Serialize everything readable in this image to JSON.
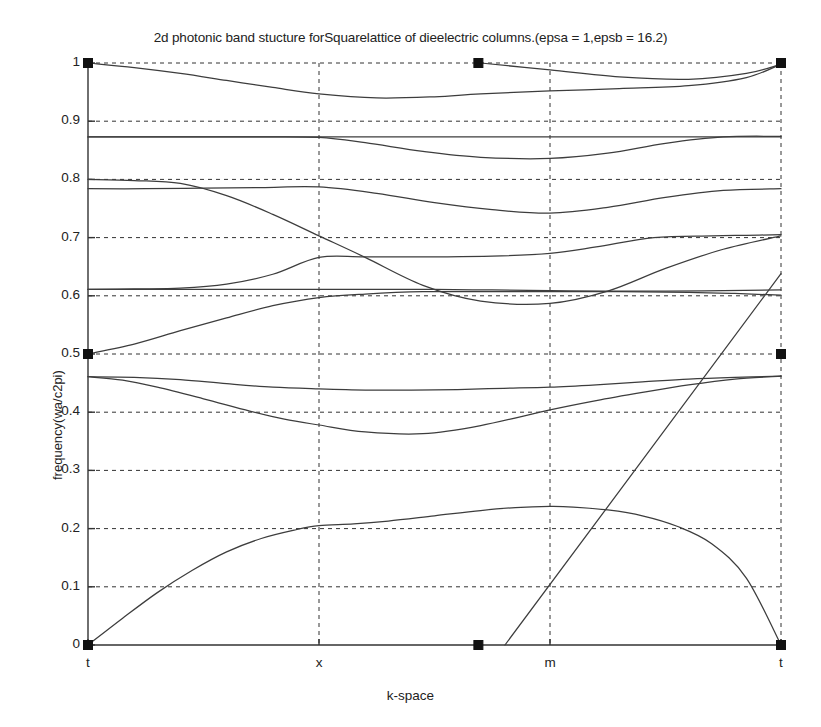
{
  "figure": {
    "title": "2d photonic band stucture forSquarelattice of dieelectric columns.(epsa = 1,epsb = 16.2)",
    "xlabel": "k-space",
    "ylabel": "frequency(wa/c2pi)"
  },
  "chart_data": {
    "type": "line",
    "title": "2d photonic band stucture forSquarelattice of dieelectric columns.(epsa = 1,epsb = 16.2)",
    "xlabel": "k-space",
    "ylabel": "frequency(wa/c2pi)",
    "xlim": [
      0,
      3
    ],
    "ylim": [
      0,
      1
    ],
    "grid": true,
    "legend": null,
    "parameters": {
      "epsa": 1,
      "epsb": 16.2,
      "lattice": "Square"
    },
    "xticks": [
      0,
      1,
      2,
      3
    ],
    "xticklabels": [
      "t",
      "x",
      "m",
      "t"
    ],
    "yticks": [
      0,
      0.1,
      0.2,
      0.3,
      0.4,
      0.5,
      0.6,
      0.7,
      0.8,
      0.9,
      1
    ],
    "yticklabels": [
      "0",
      "0.1",
      "0.2",
      "0.3",
      "0.4",
      "0.5",
      "0.6",
      "0.7",
      "0.8",
      "0.9",
      "1"
    ],
    "symmetry_points": [
      "t",
      "x",
      "m",
      "t"
    ],
    "series": [
      {
        "name": "band-1",
        "x": [
          0.0,
          0.15,
          0.3,
          0.45,
          0.6,
          0.75,
          0.9,
          1.0,
          1.15,
          1.3,
          1.5,
          1.7,
          1.85,
          2.0,
          2.1,
          2.25,
          2.4,
          2.55,
          2.7,
          2.85,
          3.0
        ],
        "y": [
          0.0,
          0.046,
          0.09,
          0.128,
          0.16,
          0.183,
          0.198,
          0.205,
          0.208,
          0.213,
          0.222,
          0.231,
          0.236,
          0.238,
          0.237,
          0.232,
          0.222,
          0.204,
          0.174,
          0.115,
          0.0
        ]
      },
      {
        "name": "band-2",
        "x": [
          0.0,
          0.2,
          0.4,
          0.6,
          0.8,
          1.0,
          1.2,
          1.4,
          1.6,
          1.8,
          2.0,
          2.2,
          2.4,
          2.6,
          2.8,
          3.0
        ],
        "y": [
          0.461,
          0.46,
          0.456,
          0.449,
          0.443,
          0.44,
          0.438,
          0.438,
          0.439,
          0.441,
          0.443,
          0.447,
          0.452,
          0.457,
          0.46,
          0.462
        ]
      },
      {
        "name": "band-3",
        "x": [
          0.0,
          0.15,
          0.3,
          0.5,
          0.7,
          0.85,
          1.0,
          1.2,
          1.45,
          1.7,
          2.0,
          2.2,
          2.4,
          2.6,
          2.8,
          3.0
        ],
        "y": [
          0.461,
          0.455,
          0.443,
          0.423,
          0.402,
          0.388,
          0.378,
          0.366,
          0.363,
          0.377,
          0.404,
          0.42,
          0.434,
          0.447,
          0.457,
          0.462
        ]
      },
      {
        "name": "band-4",
        "x": [
          0.0,
          0.2,
          0.4,
          0.6,
          0.8,
          1.0,
          1.2,
          1.45,
          1.7,
          2.0,
          2.3,
          2.6,
          2.8,
          3.0
        ],
        "y": [
          0.5,
          0.517,
          0.54,
          0.562,
          0.583,
          0.597,
          0.603,
          0.607,
          0.607,
          0.607,
          0.607,
          0.606,
          0.604,
          0.601
        ]
      },
      {
        "name": "band-5",
        "x": [
          0.0,
          0.2,
          0.4,
          0.6,
          0.8,
          1.0,
          1.2,
          1.5,
          1.75,
          2.0,
          2.2,
          2.45,
          2.7,
          2.85,
          3.0
        ],
        "y": [
          0.611,
          0.612,
          0.613,
          0.62,
          0.637,
          0.666,
          0.667,
          0.667,
          0.668,
          0.673,
          0.684,
          0.7,
          0.703,
          0.704,
          0.705
        ]
      },
      {
        "name": "band-6",
        "x": [
          0.0,
          0.2,
          0.4,
          0.6,
          0.8,
          1.0,
          1.25,
          1.5,
          1.75,
          2.0,
          2.25,
          2.5,
          2.75,
          3.0
        ],
        "y": [
          0.611,
          0.611,
          0.611,
          0.611,
          0.611,
          0.611,
          0.611,
          0.611,
          0.61,
          0.609,
          0.608,
          0.608,
          0.609,
          0.61
        ]
      },
      {
        "name": "band-7",
        "x": [
          0.0,
          0.2,
          0.4,
          0.6,
          0.8,
          1.0,
          1.2,
          1.45,
          1.7,
          2.0,
          2.25,
          2.5,
          2.75,
          3.0
        ],
        "y": [
          0.8,
          0.798,
          0.793,
          0.772,
          0.74,
          0.703,
          0.666,
          0.618,
          0.591,
          0.587,
          0.608,
          0.647,
          0.68,
          0.703
        ]
      },
      {
        "name": "band-8",
        "x": [
          0.0,
          0.25,
          0.5,
          0.75,
          1.0,
          1.25,
          1.5,
          1.75,
          2.0,
          2.25,
          2.5,
          2.75,
          3.0
        ],
        "y": [
          0.784,
          0.784,
          0.785,
          0.786,
          0.787,
          0.776,
          0.76,
          0.748,
          0.742,
          0.752,
          0.769,
          0.781,
          0.784
        ]
      },
      {
        "name": "band-9",
        "x": [
          0.0,
          0.3,
          0.6,
          1.0,
          1.3,
          1.6,
          2.0,
          2.3,
          2.6,
          3.0
        ],
        "y": [
          0.873,
          0.873,
          0.873,
          0.873,
          0.873,
          0.873,
          0.873,
          0.873,
          0.873,
          0.873
        ]
      },
      {
        "name": "band-10",
        "x": [
          0.0,
          0.25,
          0.5,
          0.75,
          1.0,
          1.2,
          1.45,
          1.7,
          2.0,
          2.25,
          2.5,
          2.75,
          3.0
        ],
        "y": [
          0.873,
          0.873,
          0.873,
          0.873,
          0.872,
          0.863,
          0.848,
          0.838,
          0.836,
          0.845,
          0.862,
          0.873,
          0.874
        ]
      },
      {
        "name": "band-11",
        "x": [
          0.0,
          0.2,
          0.4,
          0.6,
          0.8,
          1.0,
          1.25,
          1.5,
          1.7,
          2.0,
          2.3,
          2.6,
          2.85,
          3.0
        ],
        "y": [
          1.0,
          0.992,
          0.982,
          0.97,
          0.958,
          0.947,
          0.94,
          0.942,
          0.947,
          0.952,
          0.956,
          0.961,
          0.975,
          0.998
        ]
      },
      {
        "name": "band-12",
        "x": [
          1.7,
          2.0,
          2.3,
          2.6,
          2.85,
          3.0
        ],
        "y": [
          1.0,
          0.988,
          0.976,
          0.972,
          0.982,
          0.998
        ]
      },
      {
        "name": "stray-line",
        "x": [
          1.805,
          3.0
        ],
        "y": [
          0.0,
          0.638
        ]
      }
    ],
    "markers": [
      {
        "x": 0.0,
        "y": 1.0
      },
      {
        "x": 0.0,
        "y": 0.5
      },
      {
        "x": 0.0,
        "y": 0.0
      },
      {
        "x": 1.69,
        "y": 1.0
      },
      {
        "x": 1.69,
        "y": 0.0
      },
      {
        "x": 3.0,
        "y": 1.0
      },
      {
        "x": 3.0,
        "y": 0.5
      },
      {
        "x": 3.0,
        "y": 0.0
      }
    ]
  },
  "axes_geometry": {
    "left": 88,
    "right": 781,
    "top": 63,
    "bottom": 645
  }
}
